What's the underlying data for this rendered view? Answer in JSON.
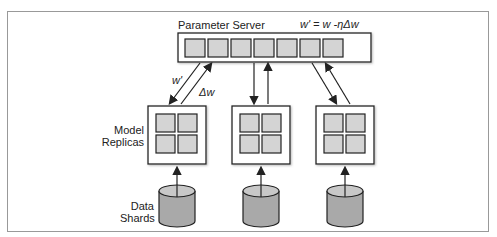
{
  "diagram": {
    "title": "Parameter Server",
    "formula": "w' = w -ηΔw",
    "arrow_down_label": "w'",
    "arrow_up_label": "Δw",
    "replicas_label_line1": "Model",
    "replicas_label_line2": "Replicas",
    "shards_label_line1": "Data",
    "shards_label_line2": "Shards",
    "param_cells": 7,
    "replica_count": 3,
    "colors": {
      "cell_fill": "#d4d4d4",
      "cylinder_fill": "#a9a9a9",
      "cylinder_top": "#c8c8c8",
      "stroke": "#222222",
      "frame": "#999999"
    }
  }
}
